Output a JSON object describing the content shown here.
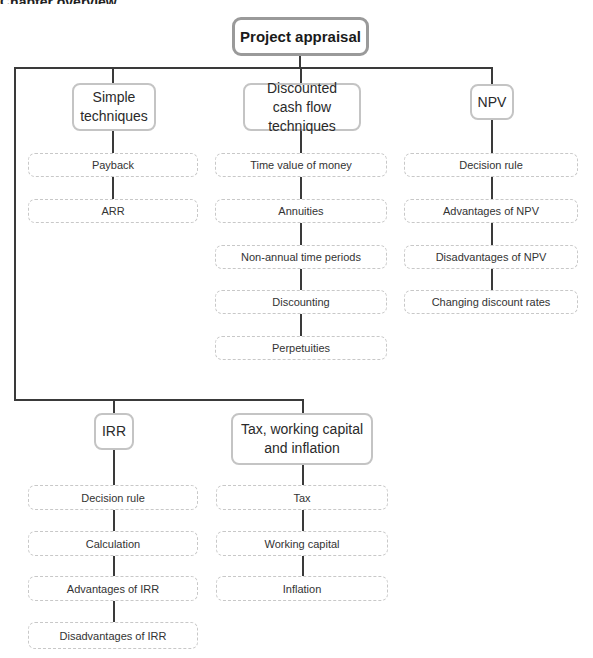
{
  "diagram": {
    "type": "tree",
    "top_cut_text": "Chapter overview",
    "root": {
      "label": "Project appraisal"
    },
    "branches": [
      {
        "label": "Simple techniques",
        "children": [
          "Payback",
          "ARR"
        ]
      },
      {
        "label": "Discounted cash flow techniques",
        "children": [
          "Time value of money",
          "Annuities",
          "Non-annual time periods",
          "Discounting",
          "Perpetuities"
        ]
      },
      {
        "label": "NPV",
        "children": [
          "Decision rule",
          "Advantages of NPV",
          "Disadvantages of NPV",
          "Changing discount rates"
        ]
      },
      {
        "label": "IRR",
        "children": [
          "Decision rule",
          "Calculation",
          "Advantages of IRR",
          "Disadvantages of IRR"
        ]
      },
      {
        "label": "Tax, working capital and inflation",
        "children": [
          "Tax",
          "Working capital",
          "Inflation"
        ]
      }
    ]
  },
  "colors": {
    "line": "#3a3a3a",
    "root_border": "#9a9a9a",
    "head_border": "#c4c4c4",
    "leaf_border": "#c8c8c8"
  }
}
